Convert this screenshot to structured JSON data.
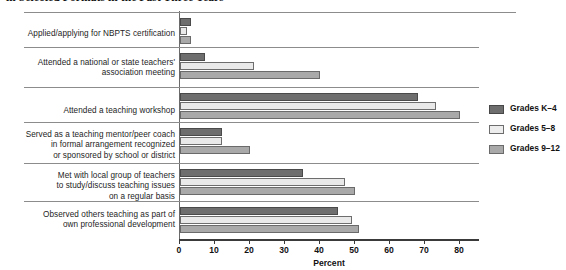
{
  "chart_data": {
    "type": "bar",
    "orientation": "horizontal",
    "title": "in Selected Formats in the Past Three Years",
    "xlabel": "Percent",
    "ylabel": "",
    "xlim": [
      0,
      80
    ],
    "xticks": [
      0,
      10,
      20,
      30,
      40,
      50,
      60,
      70,
      80
    ],
    "grid": false,
    "legend_position": "right",
    "categories": [
      "Applied/applying for NBPTS certification",
      "Attended a national or state teachers' association meeting",
      "Attended a teaching workshop",
      "Served as a teaching mentor/peer coach in formal arrangement recognized or sponsored by school or district",
      "Met with local group of teachers to study/discuss teaching issues on a regular basis",
      "Observed others teaching as part of own professional development"
    ],
    "category_lines": [
      [
        "Applied/applying for NBPTS certification"
      ],
      [
        "Attended a national or state teachers'",
        "association meeting"
      ],
      [
        "Attended a teaching workshop"
      ],
      [
        "Served as a teaching mentor/peer coach",
        "in formal arrangement recognized",
        "or sponsored by school or district"
      ],
      [
        "Met with local group of teachers",
        "to study/discuss teaching issues",
        "on a regular basis"
      ],
      [
        "Observed others teaching as part of",
        "own professional development"
      ]
    ],
    "series": [
      {
        "name": "Grades K-4",
        "color": "#6e6e6e",
        "values": [
          3,
          7,
          68,
          12,
          35,
          45
        ]
      },
      {
        "name": "Grades 5-8",
        "color": "#e9e9e9",
        "values": [
          2,
          21,
          73,
          12,
          47,
          49
        ]
      },
      {
        "name": "Grades 9-12",
        "color": "#a9a9a9",
        "values": [
          3,
          40,
          80,
          20,
          50,
          51
        ]
      }
    ]
  },
  "legend": {
    "items": [
      {
        "label": "Grades K–4"
      },
      {
        "label": "Grades 5–8"
      },
      {
        "label": "Grades 9–12"
      }
    ]
  },
  "axis": {
    "tick_labels": [
      "0",
      "10",
      "20",
      "30",
      "40",
      "50",
      "60",
      "70",
      "80"
    ],
    "title": "Percent"
  }
}
